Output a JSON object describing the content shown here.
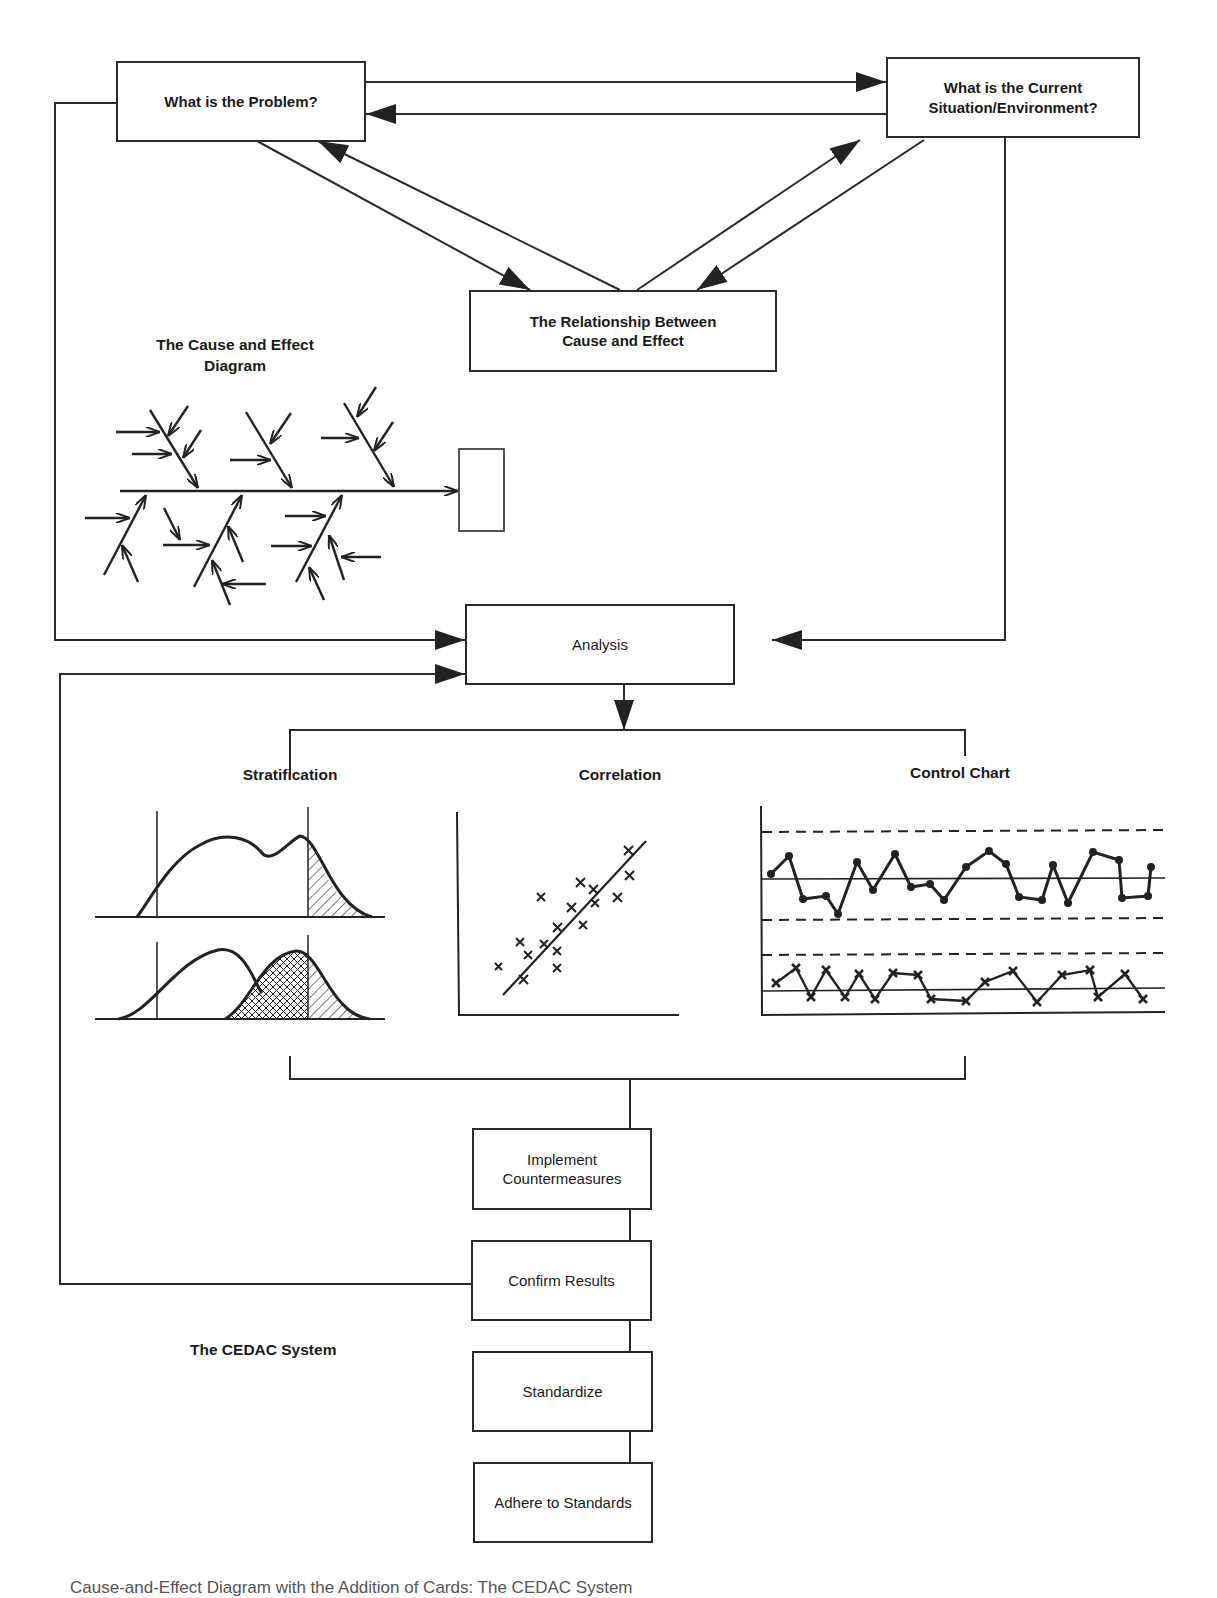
{
  "diagram": {
    "title": "The CEDAC System",
    "boxes": {
      "problem": "What is the Problem?",
      "current_situation_line1": "What is the Current",
      "current_situation_line2": "Situation/Environment?",
      "relationship_line1": "The Relationship Between",
      "relationship_line2": "Cause and Effect",
      "analysis": "Analysis",
      "implement_line1": "Implement",
      "implement_line2": "Countermeasures",
      "confirm": "Confirm Results",
      "standardize": "Standardize",
      "adhere": "Adhere to Standards"
    },
    "labels": {
      "cause_effect_line1": "The Cause and Effect",
      "cause_effect_line2": "Diagram",
      "stratification": "Stratification",
      "correlation": "Correlation",
      "control_chart": "Control Chart",
      "system_name": "The CEDAC System"
    },
    "caption_fragment": "Cause-and-Effect Diagram with the Addition of Cards: The CEDAC System"
  },
  "colors": {
    "line": "#2a2a2a",
    "background": "#ffffff"
  }
}
